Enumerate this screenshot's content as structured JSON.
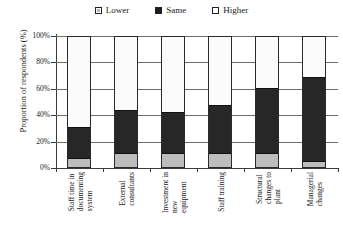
{
  "legend": {
    "position": "top-center",
    "items": [
      {
        "label": "Lower",
        "swatch": "legend-swatch-lower",
        "color": "#b9b9b9"
      },
      {
        "label": "Same",
        "swatch": "legend-swatch-same",
        "color": "#1c1c1c"
      },
      {
        "label": "Higher",
        "swatch": "legend-swatch-higher",
        "color": "#ffffff"
      }
    ]
  },
  "axes": {
    "ylabel": "Proportion of respondents (%)",
    "yticks": [
      "0%",
      "20%",
      "40%",
      "60%",
      "80%",
      "100%"
    ],
    "xlabel": ""
  },
  "chart_data": {
    "type": "bar",
    "title": "",
    "subtitle": "",
    "xlabel": "",
    "ylabel": "Proportion of respondents (%)",
    "ylim": [
      0,
      100
    ],
    "ytick_labels": [
      "0%",
      "20%",
      "40%",
      "60%",
      "80%",
      "100%"
    ],
    "ytick_values": [
      0,
      20,
      40,
      60,
      80,
      100
    ],
    "grid": true,
    "stacked": true,
    "legend_position": "top-center",
    "categories": [
      "Staff time in documenting system",
      "External consultants",
      "Investment in new equipment",
      "Staff training",
      "Structural changes to plant",
      "Managerial changes"
    ],
    "category_lines": [
      [
        "Staff time in",
        "documenting",
        "system"
      ],
      [
        "External",
        "consultants"
      ],
      [
        "Investment in",
        "new",
        "equipment"
      ],
      [
        "Staff training"
      ],
      [
        "Structural",
        "changes to",
        "plant"
      ],
      [
        "Managerial",
        "changes"
      ]
    ],
    "series": [
      {
        "name": "Lower",
        "color": "#b9b9b9",
        "values": [
          6,
          10,
          10,
          10,
          10,
          4
        ]
      },
      {
        "name": "Same",
        "color": "#272727",
        "values": [
          25,
          34,
          32,
          38,
          51,
          65
        ]
      },
      {
        "name": "Higher",
        "color": "#fbfbfb",
        "values": [
          69,
          56,
          58,
          52,
          39,
          31
        ]
      }
    ]
  }
}
